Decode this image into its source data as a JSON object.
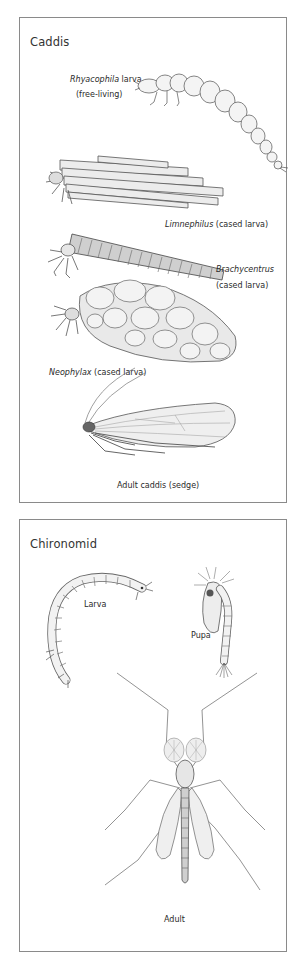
{
  "panels": [
    {
      "title": "Caddis",
      "figures": [
        {
          "name": "rhyacophila-larva",
          "label_italic": "Rhyacophila",
          "label_rest": " larva",
          "label_line2": "(free-living)"
        },
        {
          "name": "limnephilus-cased-larva",
          "label_italic": "Limnephilus",
          "label_rest": " (cased larva)"
        },
        {
          "name": "brachycentrus-cased-larva",
          "label_italic": "Brachycentrus",
          "label_line2": "(cased larva)"
        },
        {
          "name": "neophylax-cased-larva",
          "label_italic": "Neophylax",
          "label_rest": " (cased larva)"
        },
        {
          "name": "adult-caddis",
          "label": "Adult caddis (sedge)"
        }
      ]
    },
    {
      "title": "Chironomid",
      "figures": [
        {
          "name": "chironomid-larva",
          "label": "Larva"
        },
        {
          "name": "chironomid-pupa",
          "label": "Pupa"
        },
        {
          "name": "chironomid-adult",
          "label": "Adult"
        }
      ]
    }
  ],
  "colors": {
    "border": "#8a8a8a",
    "ink": "#555555",
    "text": "#2a2a2a"
  }
}
